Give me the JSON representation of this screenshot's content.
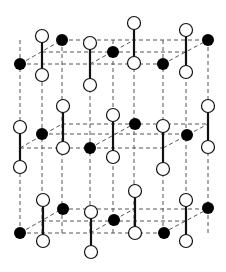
{
  "diagram": {
    "type": "crystal-lattice",
    "colors": {
      "background": "#ffffff",
      "dashed_line": "#555555",
      "bond": "#111111",
      "atom_fill": "#000000",
      "molecule_fill": "#ffffff",
      "molecule_stroke": "#111111"
    },
    "vertical_lines_x": [
      20,
      42,
      62,
      90,
      113,
      134,
      163,
      186,
      208
    ],
    "layers": [
      {
        "name": "top",
        "front_y": 64,
        "middle_y": 52,
        "back_y": 40,
        "atoms": [
          [
            20,
            64
          ],
          [
            62,
            40
          ],
          [
            113,
            52
          ],
          [
            163,
            64
          ],
          [
            208,
            40
          ]
        ],
        "dumbbells": [
          [
            42,
            36,
            75
          ],
          [
            90,
            43,
            85
          ],
          [
            134,
            23,
            63
          ],
          [
            186,
            30,
            72
          ]
        ]
      },
      {
        "name": "middle",
        "front_y": 148,
        "middle_y": 134,
        "back_y": 124,
        "atoms": [
          [
            42,
            134
          ],
          [
            90,
            148
          ],
          [
            135,
            124
          ],
          [
            187,
            135
          ]
        ],
        "dumbbells": [
          [
            20,
            127,
            167
          ],
          [
            63,
            106,
            148
          ],
          [
            113,
            115,
            157
          ],
          [
            163,
            126,
            169
          ],
          [
            208,
            106,
            147
          ]
        ]
      },
      {
        "name": "bottom",
        "front_y": 233,
        "middle_y": 221,
        "back_y": 209,
        "atoms": [
          [
            20,
            233
          ],
          [
            63,
            209
          ],
          [
            114,
            220
          ],
          [
            164,
            233
          ],
          [
            208,
            208
          ]
        ],
        "dumbbells": [
          [
            43,
            200,
            241
          ],
          [
            91,
            212,
            252
          ],
          [
            135,
            191,
            233
          ],
          [
            186,
            200,
            241
          ]
        ]
      }
    ]
  }
}
